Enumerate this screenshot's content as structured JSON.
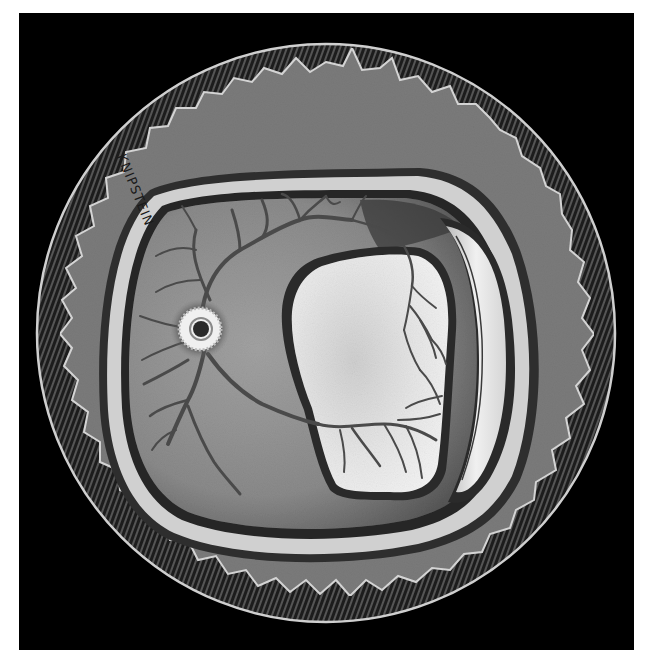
{
  "illustration": {
    "subject": "fundus-retinal-detachment-illustration",
    "signature": "KNIPSTEIN",
    "colors": {
      "page_background": "#ffffff",
      "panel_background": "#000000",
      "outer_field": "#7b7b7b",
      "rim_stroke": "#c8c8c8",
      "globe_rim": "#d2d2d2",
      "retina": "#8c8c8c",
      "retina_dark": "#3c3c3c",
      "detached_retina": "#e4e4e4",
      "vessel": "#4a4a4a",
      "optic_disc_ring": "#f2f2f2",
      "optic_disc_center": "#222222"
    }
  }
}
